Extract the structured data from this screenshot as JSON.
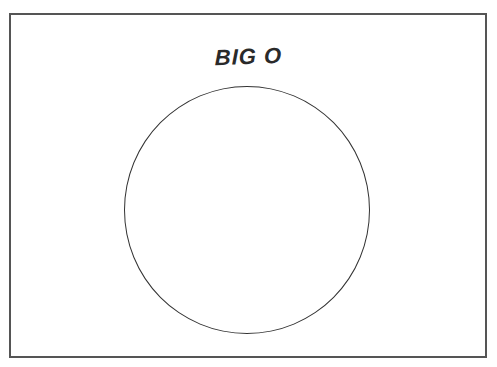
{
  "diagram": {
    "title": "BIG O",
    "shape": "circle",
    "colors": {
      "border": "#555555",
      "circle_stroke": "#333333",
      "text": "#2a2a2a",
      "background": "#ffffff"
    }
  }
}
